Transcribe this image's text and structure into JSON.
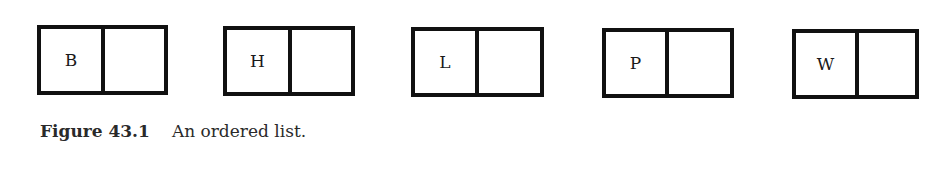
{
  "figure": {
    "nodes": [
      {
        "label": "B",
        "left": 37,
        "top": 25,
        "dataWidth": 60,
        "nextWidth": 59
      },
      {
        "label": "H",
        "left": 223,
        "top": 26,
        "dataWidth": 61,
        "nextWidth": 59
      },
      {
        "label": "L",
        "left": 411,
        "top": 27,
        "dataWidth": 60,
        "nextWidth": 61
      },
      {
        "label": "P",
        "left": 602,
        "top": 28,
        "dataWidth": 59,
        "nextWidth": 61
      },
      {
        "label": "W",
        "left": 792,
        "top": 29,
        "dataWidth": 59,
        "nextWidth": 56
      }
    ],
    "caption": {
      "number": "Figure 43.1",
      "text": "An ordered list."
    }
  }
}
